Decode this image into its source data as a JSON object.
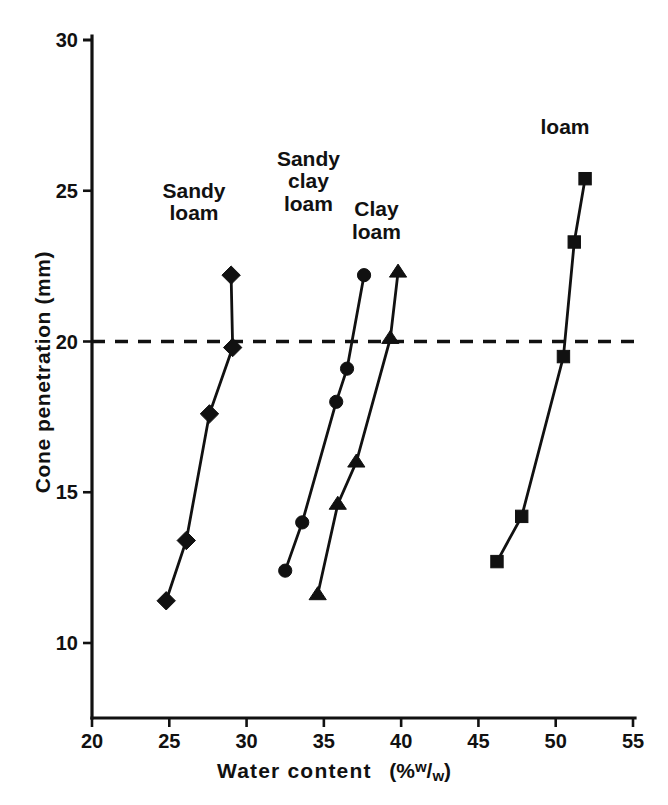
{
  "chart_data": {
    "type": "line",
    "title": "",
    "xlabel": "Water content  (% w/w)",
    "ylabel": "Cone penetration  (mm)",
    "xlim": [
      20,
      55
    ],
    "ylim": [
      8,
      30
    ],
    "xticks": [
      20,
      25,
      30,
      35,
      40,
      45,
      50,
      55
    ],
    "yticks": [
      10,
      15,
      20,
      25,
      30
    ],
    "xtick_labels": [
      "20",
      "25",
      "30",
      "35",
      "40",
      "45",
      "50",
      "55"
    ],
    "ytick_labels": [
      "10",
      "15",
      "20",
      "25",
      "30"
    ],
    "grid": false,
    "legend": "inline-annotations",
    "annotations": [
      {
        "text": "Sandy\nloam",
        "x": 26.6,
        "y": 24.6
      },
      {
        "text": "Sandy\nclay\nloam",
        "x": 34.0,
        "y": 25.3
      },
      {
        "text": "Clay\nloam",
        "x": 38.4,
        "y": 24.0
      },
      {
        "text": "loam",
        "x": 50.6,
        "y": 27.1
      }
    ],
    "reference_lines": [
      {
        "axis": "y",
        "value": 20,
        "style": "dashed",
        "label": ""
      }
    ],
    "series": [
      {
        "name": "Sandy loam",
        "marker": "diamond",
        "x": [
          24.8,
          26.1,
          27.6,
          29.1,
          29.0
        ],
        "y": [
          11.4,
          13.4,
          17.6,
          19.8,
          22.2
        ]
      },
      {
        "name": "Sandy clay loam",
        "marker": "circle",
        "x": [
          32.5,
          33.6,
          35.8,
          36.5,
          37.6
        ],
        "y": [
          12.4,
          14.0,
          18.0,
          19.1,
          22.2
        ]
      },
      {
        "name": "Clay loam",
        "marker": "triangle",
        "x": [
          34.6,
          35.9,
          37.1,
          39.3,
          39.8
        ],
        "y": [
          11.6,
          14.6,
          16.0,
          20.1,
          22.3
        ]
      },
      {
        "name": "loam",
        "marker": "square",
        "x": [
          46.2,
          47.8,
          50.5,
          51.2,
          51.9
        ],
        "y": [
          12.7,
          14.2,
          19.5,
          23.3,
          25.4
        ]
      }
    ]
  },
  "axes": {
    "x_title_main": "Water content",
    "x_title_unit_open": "(%",
    "x_title_unit_sup": "w",
    "x_title_unit_slash": "/",
    "x_title_unit_sub": "w",
    "x_title_unit_close": ")",
    "y_title": "Cone penetration  (mm)"
  }
}
